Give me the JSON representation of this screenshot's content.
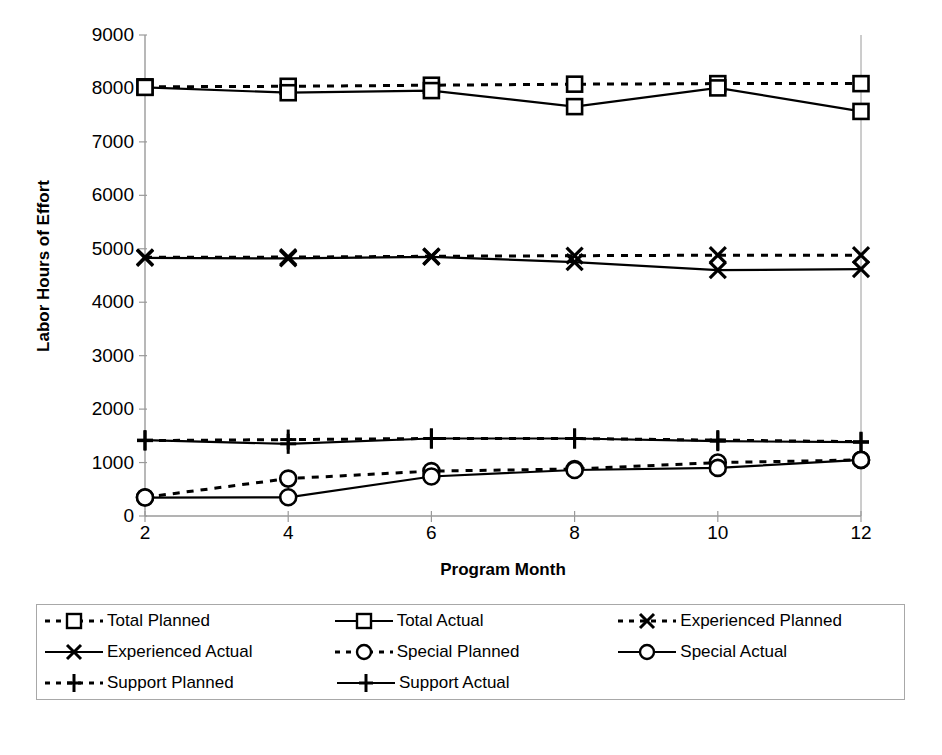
{
  "chart_data": {
    "type": "line",
    "title": "",
    "xlabel": "Program Month",
    "ylabel": "Labor Hours of Effort",
    "x": [
      2,
      4,
      6,
      8,
      10,
      12
    ],
    "xtick_labels": [
      "2",
      "4",
      "6",
      "8",
      "10",
      "12"
    ],
    "ytick_labels": [
      "0",
      "1000",
      "2000",
      "3000",
      "4000",
      "5000",
      "6000",
      "7000",
      "8000",
      "9000"
    ],
    "yticks": [
      0,
      1000,
      2000,
      3000,
      4000,
      5000,
      6000,
      7000,
      8000,
      9000
    ],
    "xlim": [
      2,
      12
    ],
    "ylim": [
      0,
      9000
    ],
    "grid": false,
    "legend_position": "below-plot",
    "series": [
      {
        "name": "Total Planned",
        "marker": "square",
        "linestyle": "dotted",
        "color": "#000000",
        "values": [
          8030,
          8040,
          8060,
          8080,
          8090,
          8090
        ]
      },
      {
        "name": "Total Actual",
        "marker": "square",
        "linestyle": "solid",
        "color": "#000000",
        "values": [
          8020,
          7920,
          7960,
          7660,
          8010,
          7570
        ]
      },
      {
        "name": "Experienced Planned",
        "marker": "x",
        "linestyle": "dotted",
        "color": "#000000",
        "values": [
          4840,
          4845,
          4860,
          4870,
          4880,
          4880
        ]
      },
      {
        "name": "Experienced Actual",
        "marker": "x",
        "linestyle": "solid",
        "color": "#000000",
        "values": [
          4830,
          4820,
          4850,
          4750,
          4600,
          4620
        ]
      },
      {
        "name": "Special Planned",
        "marker": "circle",
        "linestyle": "dotted",
        "color": "#000000",
        "values": [
          350,
          700,
          840,
          880,
          1000,
          1050
        ]
      },
      {
        "name": "Special Actual",
        "marker": "circle",
        "linestyle": "solid",
        "color": "#000000",
        "values": [
          345,
          350,
          740,
          860,
          900,
          1050
        ]
      },
      {
        "name": "Support Planned",
        "marker": "plus",
        "linestyle": "dotted",
        "color": "#000000",
        "values": [
          1410,
          1430,
          1450,
          1450,
          1420,
          1390
        ]
      },
      {
        "name": "Support Actual",
        "marker": "plus",
        "linestyle": "solid",
        "color": "#000000",
        "values": [
          1420,
          1350,
          1450,
          1450,
          1400,
          1380
        ]
      }
    ]
  },
  "legend": {
    "rows": [
      [
        {
          "label": "Total Planned",
          "marker": "square",
          "linestyle": "dotted"
        },
        {
          "label": "Total Actual",
          "marker": "square",
          "linestyle": "solid"
        },
        {
          "label": "Experienced Planned",
          "marker": "x",
          "linestyle": "dotted"
        }
      ],
      [
        {
          "label": "Experienced Actual",
          "marker": "x",
          "linestyle": "solid"
        },
        {
          "label": "Special Planned",
          "marker": "circle",
          "linestyle": "dotted"
        },
        {
          "label": "Special Actual",
          "marker": "circle",
          "linestyle": "solid"
        }
      ],
      [
        {
          "label": "Support Planned",
          "marker": "plus",
          "linestyle": "dotted"
        },
        {
          "label": "Support Actual",
          "marker": "plus",
          "linestyle": "solid"
        }
      ]
    ]
  },
  "style": {
    "axis_color": "#9a9a9a",
    "series_color": "#000000",
    "background": "#ffffff",
    "legend_border": "#a8a8a8"
  }
}
